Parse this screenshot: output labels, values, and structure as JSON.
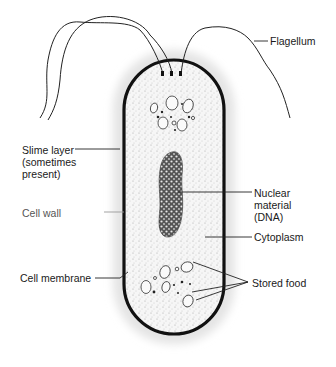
{
  "diagram": {
    "labels": {
      "flagellum": "Flagellum",
      "slime_layer": "Slime layer\n(sometimes\npresent)",
      "cell_wall": "Cell wall",
      "nuclear_material": "Nuclear\nmaterial\n(DNA)",
      "cytoplasm": "Cytoplasm",
      "cell_membrane": "Cell membrane",
      "stored_food": "Stored food"
    },
    "colors": {
      "outline": "#111111",
      "slime_layer": "#e6e6e6",
      "cytoplasm": "#f4f4f4",
      "label_text": "#1a1a1a"
    }
  }
}
